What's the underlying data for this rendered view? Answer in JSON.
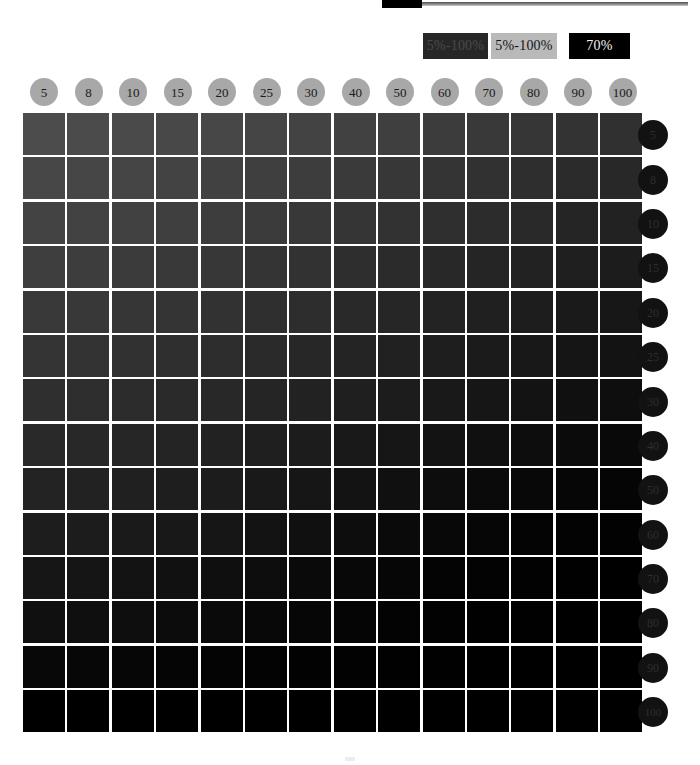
{
  "legend": {
    "swatches": [
      {
        "name": "range-dark",
        "label": "5%-100%",
        "bg": "#272727",
        "fg": "#4a4a4a"
      },
      {
        "name": "range-light",
        "label": "5%-100%",
        "bg": "#b9b9b9",
        "fg": "#141414"
      },
      {
        "name": "single-value",
        "label": "70%",
        "bg": "#000000",
        "fg": "#f2f2f2"
      }
    ]
  },
  "chart_data": {
    "type": "heatmap",
    "title": "",
    "xlabel": "",
    "ylabel": "",
    "grid": false,
    "legend_position": "top-right",
    "colorscale": "black-ink-density",
    "categories": [
      "5",
      "8",
      "10",
      "15",
      "20",
      "25",
      "30",
      "40",
      "50",
      "60",
      "70",
      "80",
      "90",
      "100"
    ],
    "rows": [
      "5",
      "8",
      "10",
      "15",
      "20",
      "25",
      "30",
      "40",
      "50",
      "60",
      "70",
      "80",
      "90",
      "100"
    ],
    "column_header_color": "#a8a8a8",
    "row_header_color": "#121212",
    "values": [
      [
        30,
        31,
        32,
        33,
        34,
        35,
        36,
        37,
        38,
        40,
        42,
        44,
        46,
        48
      ],
      [
        32,
        33,
        34,
        35,
        36,
        37,
        38,
        40,
        42,
        44,
        46,
        48,
        50,
        52
      ],
      [
        34,
        35,
        36,
        37,
        38,
        40,
        42,
        44,
        46,
        48,
        50,
        52,
        55,
        58
      ],
      [
        37,
        38,
        40,
        42,
        44,
        46,
        48,
        50,
        52,
        55,
        58,
        61,
        64,
        67
      ],
      [
        40,
        42,
        44,
        46,
        48,
        50,
        52,
        55,
        58,
        61,
        64,
        67,
        70,
        73
      ],
      [
        44,
        46,
        48,
        50,
        52,
        55,
        58,
        61,
        64,
        67,
        70,
        73,
        76,
        79
      ],
      [
        48,
        50,
        52,
        55,
        58,
        61,
        64,
        67,
        70,
        73,
        76,
        79,
        82,
        85
      ],
      [
        54,
        56,
        58,
        61,
        64,
        67,
        70,
        73,
        76,
        79,
        82,
        85,
        88,
        91
      ],
      [
        60,
        62,
        64,
        67,
        70,
        73,
        76,
        79,
        82,
        85,
        88,
        91,
        94,
        96
      ],
      [
        66,
        68,
        70,
        73,
        76,
        79,
        82,
        85,
        88,
        91,
        94,
        96,
        98,
        99
      ],
      [
        73,
        75,
        77,
        80,
        82,
        85,
        88,
        91,
        93,
        95,
        97,
        98,
        99,
        100
      ],
      [
        80,
        82,
        84,
        86,
        88,
        90,
        92,
        94,
        96,
        97,
        98,
        99,
        100,
        100
      ],
      [
        88,
        89,
        90,
        92,
        93,
        95,
        96,
        97,
        98,
        99,
        100,
        100,
        100,
        100
      ],
      [
        100,
        100,
        100,
        100,
        100,
        100,
        100,
        100,
        100,
        100,
        100,
        100,
        100,
        100
      ]
    ],
    "patch_colors": [
      [
        "#4c4c4c",
        "#4b4b4b",
        "#4a4a4a",
        "#484848",
        "#474747",
        "#454545",
        "#434343",
        "#414141",
        "#3f3f3f",
        "#3c3c3c",
        "#393939",
        "#363636",
        "#333333",
        "#303030"
      ],
      [
        "#474747",
        "#464646",
        "#454545",
        "#434343",
        "#414141",
        "#3f3f3f",
        "#3d3d3d",
        "#3a3a3a",
        "#373737",
        "#343434",
        "#313131",
        "#2e2e2e",
        "#2b2b2b",
        "#282828"
      ],
      [
        "#434343",
        "#424242",
        "#414141",
        "#3f3f3f",
        "#3d3d3d",
        "#3b3b3b",
        "#383838",
        "#353535",
        "#323232",
        "#2f2f2f",
        "#2c2c2c",
        "#292929",
        "#252525",
        "#222222"
      ],
      [
        "#3e3e3e",
        "#3d3d3d",
        "#3b3b3b",
        "#393939",
        "#373737",
        "#343434",
        "#323232",
        "#2e2e2e",
        "#2b2b2b",
        "#282828",
        "#252525",
        "#222222",
        "#1f1f1f",
        "#1c1c1c"
      ],
      [
        "#393939",
        "#383838",
        "#363636",
        "#343434",
        "#323232",
        "#2f2f2f",
        "#2d2d2d",
        "#292929",
        "#262626",
        "#232323",
        "#202020",
        "#1d1d1d",
        "#1a1a1a",
        "#171717"
      ],
      [
        "#343434",
        "#333333",
        "#313131",
        "#2f2f2f",
        "#2d2d2d",
        "#2a2a2a",
        "#272727",
        "#242424",
        "#212121",
        "#1e1e1e",
        "#1b1b1b",
        "#181818",
        "#151515",
        "#131313"
      ],
      [
        "#2f2f2f",
        "#2e2e2e",
        "#2c2c2c",
        "#2a2a2a",
        "#282828",
        "#252525",
        "#222222",
        "#1f1f1f",
        "#1c1c1c",
        "#191919",
        "#161616",
        "#131313",
        "#101010",
        "#0e0e0e"
      ],
      [
        "#292929",
        "#282828",
        "#262626",
        "#242424",
        "#222222",
        "#1f1f1f",
        "#1c1c1c",
        "#191919",
        "#161616",
        "#131313",
        "#101010",
        "#0d0d0d",
        "#0b0b0b",
        "#090909"
      ],
      [
        "#232323",
        "#222222",
        "#202020",
        "#1e1e1e",
        "#1c1c1c",
        "#191919",
        "#161616",
        "#131313",
        "#101010",
        "#0d0d0d",
        "#0a0a0a",
        "#080808",
        "#060606",
        "#050505"
      ],
      [
        "#1d1d1d",
        "#1c1c1c",
        "#1a1a1a",
        "#181818",
        "#161616",
        "#131313",
        "#101010",
        "#0d0d0d",
        "#0a0a0a",
        "#080808",
        "#060606",
        "#040404",
        "#030303",
        "#020202"
      ],
      [
        "#161616",
        "#151515",
        "#131313",
        "#111111",
        "#0f0f0f",
        "#0d0d0d",
        "#0a0a0a",
        "#080808",
        "#060606",
        "#040404",
        "#030303",
        "#020202",
        "#010101",
        "#000000"
      ],
      [
        "#101010",
        "#0f0f0f",
        "#0e0e0e",
        "#0c0c0c",
        "#0a0a0a",
        "#080808",
        "#060606",
        "#050505",
        "#030303",
        "#020202",
        "#010101",
        "#010101",
        "#000000",
        "#000000"
      ],
      [
        "#080808",
        "#070707",
        "#060606",
        "#050505",
        "#040404",
        "#030303",
        "#020202",
        "#020202",
        "#010101",
        "#010101",
        "#000000",
        "#000000",
        "#000000",
        "#000000"
      ],
      [
        "#000000",
        "#000000",
        "#000000",
        "#000000",
        "#000000",
        "#000000",
        "#000000",
        "#000000",
        "#000000",
        "#000000",
        "#000000",
        "#000000",
        "#000000",
        "#000000"
      ]
    ]
  }
}
